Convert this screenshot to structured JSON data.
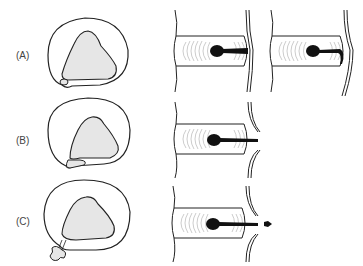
{
  "figure": {
    "rows": [
      {
        "label": "(A)",
        "stage": "protrusion"
      },
      {
        "label": "(B)",
        "stage": "extrusion"
      },
      {
        "label": "(C)",
        "stage": "sequestration"
      }
    ],
    "colors": {
      "outline": "#222222",
      "nucleus_fill": "#e6e6e6",
      "nucleus_dark": "#111111",
      "background": "#ffffff"
    }
  }
}
